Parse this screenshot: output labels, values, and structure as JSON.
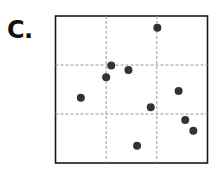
{
  "panel_label": "C.",
  "chart_data": {
    "type": "scatter",
    "title": "",
    "xlabel": "",
    "ylabel": "",
    "xlim": [
      0,
      3
    ],
    "ylim": [
      0,
      3
    ],
    "grid": true,
    "grid_style": "dashed",
    "gridlines_x": [
      1,
      2
    ],
    "gridlines_y": [
      1,
      2
    ],
    "axis_ticks": "none",
    "legend": "none",
    "point_color": "#333333",
    "series": [
      {
        "name": "points",
        "points": [
          {
            "x": 2.01,
            "y": 2.76
          },
          {
            "x": 1.1,
            "y": 1.99
          },
          {
            "x": 1.44,
            "y": 1.9
          },
          {
            "x": 1.0,
            "y": 1.75
          },
          {
            "x": 0.5,
            "y": 1.33
          },
          {
            "x": 2.43,
            "y": 1.47
          },
          {
            "x": 1.88,
            "y": 1.14
          },
          {
            "x": 2.56,
            "y": 0.88
          },
          {
            "x": 2.72,
            "y": 0.66
          },
          {
            "x": 1.61,
            "y": 0.35
          }
        ]
      }
    ]
  }
}
